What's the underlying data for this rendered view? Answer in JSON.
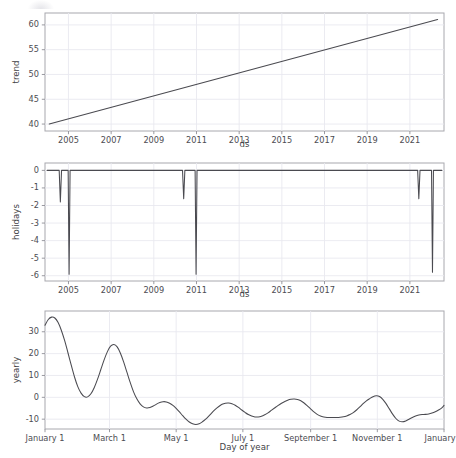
{
  "figure": {
    "background": "#ffffff",
    "line_color": "#4a4a50",
    "grid_color": "#e9e9ef",
    "frame_color": "#a8a8ae"
  },
  "chart_data": [
    {
      "type": "line",
      "name": "trend",
      "title": "",
      "xlabel": "ds",
      "ylabel": "trend",
      "grid": true,
      "legend": "none",
      "xlim": [
        2003.9,
        2022.6
      ],
      "ylim": [
        38.6,
        62.4
      ],
      "yticks": [
        40,
        45,
        50,
        55,
        60
      ],
      "yticklabels": [
        "40",
        "45",
        "50",
        "55",
        "60"
      ],
      "xticks": [
        2005,
        2007,
        2009,
        2011,
        2013,
        2015,
        2017,
        2019,
        2021
      ],
      "xticklabels": [
        "2005",
        "2007",
        "2009",
        "2011",
        "2013",
        "2015",
        "2017",
        "2019",
        "2021"
      ],
      "x": [
        2004.1,
        2022.3
      ],
      "y": [
        40.0,
        61.1
      ]
    },
    {
      "type": "line",
      "name": "holidays",
      "title": "",
      "xlabel": "ds",
      "ylabel": "holidays",
      "grid": true,
      "legend": "none",
      "xlim": [
        2003.9,
        2022.6
      ],
      "ylim": [
        -6.3,
        0.42
      ],
      "yticks": [
        0,
        -1,
        -2,
        -3,
        -4,
        -5,
        -6
      ],
      "yticklabels": [
        "0",
        "-1",
        "-2",
        "-3",
        "-4",
        "-5",
        "-6"
      ],
      "xticks": [
        2005,
        2007,
        2009,
        2011,
        2013,
        2015,
        2017,
        2019,
        2021
      ],
      "xticklabels": [
        "2005",
        "2007",
        "2009",
        "2011",
        "2013",
        "2015",
        "2017",
        "2019",
        "2021"
      ],
      "baseline": 0,
      "spikes": [
        {
          "x": 2004.62,
          "depth": -1.8,
          "half_width": 0.055
        },
        {
          "x": 2005.03,
          "depth": -5.92,
          "half_width": 0.045
        },
        {
          "x": 2010.4,
          "depth": -1.62,
          "half_width": 0.055
        },
        {
          "x": 2010.98,
          "depth": -5.92,
          "half_width": 0.045
        },
        {
          "x": 2021.42,
          "depth": -1.62,
          "half_width": 0.055
        },
        {
          "x": 2022.06,
          "depth": -5.8,
          "half_width": 0.045
        }
      ]
    },
    {
      "type": "line",
      "name": "yearly",
      "title": "",
      "xlabel": "Day of year",
      "ylabel": "yearly",
      "grid": true,
      "legend": "none",
      "xlim": [
        0,
        365
      ],
      "ylim": [
        -14.5,
        39.5
      ],
      "yticks": [
        30,
        20,
        10,
        0,
        -10
      ],
      "yticklabels": [
        "30",
        "20",
        "10",
        "0",
        "-10"
      ],
      "xticks": [
        0,
        59,
        120,
        181,
        243,
        304,
        365
      ],
      "xticklabels": [
        "January 1",
        "March 1",
        "May 1",
        "July 1",
        "September 1",
        "November 1",
        "January 1"
      ],
      "x": [
        0,
        3,
        6,
        9,
        12,
        15,
        18,
        21,
        24,
        27,
        30,
        33,
        36,
        39,
        42,
        45,
        48,
        51,
        54,
        57,
        60,
        63,
        66,
        69,
        72,
        75,
        78,
        81,
        84,
        87,
        90,
        93,
        96,
        99,
        102,
        105,
        108,
        111,
        114,
        117,
        120,
        123,
        126,
        129,
        132,
        135,
        138,
        141,
        144,
        147,
        150,
        153,
        156,
        159,
        162,
        165,
        168,
        171,
        174,
        177,
        180,
        183,
        186,
        189,
        192,
        195,
        198,
        201,
        204,
        207,
        210,
        213,
        216,
        219,
        222,
        225,
        228,
        231,
        234,
        237,
        240,
        243,
        246,
        249,
        252,
        255,
        258,
        261,
        264,
        267,
        270,
        273,
        276,
        279,
        282,
        285,
        288,
        291,
        294,
        297,
        300,
        303,
        306,
        309,
        312,
        315,
        318,
        321,
        324,
        327,
        330,
        333,
        336,
        339,
        342,
        345,
        348,
        351,
        354,
        357,
        360,
        363,
        365
      ],
      "y": [
        33.0,
        35.6,
        36.7,
        36.3,
        34.2,
        30.6,
        25.9,
        20.4,
        14.7,
        9.3,
        4.9,
        1.9,
        0.3,
        0.2,
        1.6,
        4.4,
        8.2,
        12.6,
        17.0,
        20.8,
        23.4,
        24.2,
        23.1,
        20.2,
        16.1,
        11.4,
        6.7,
        2.5,
        -0.7,
        -3.0,
        -4.4,
        -4.9,
        -4.7,
        -4.0,
        -3.1,
        -2.4,
        -2.0,
        -2.1,
        -2.7,
        -3.7,
        -5.1,
        -6.7,
        -8.4,
        -10.0,
        -11.3,
        -12.1,
        -12.4,
        -12.1,
        -11.2,
        -10.0,
        -8.5,
        -6.9,
        -5.4,
        -4.2,
        -3.2,
        -2.7,
        -2.6,
        -2.9,
        -3.6,
        -4.6,
        -5.8,
        -6.9,
        -7.9,
        -8.6,
        -9.0,
        -9.0,
        -8.7,
        -8.0,
        -7.1,
        -6.0,
        -4.9,
        -3.8,
        -2.8,
        -2.0,
        -1.3,
        -0.9,
        -0.8,
        -1.0,
        -1.6,
        -2.6,
        -3.9,
        -5.3,
        -6.7,
        -7.8,
        -8.6,
        -9.0,
        -9.2,
        -9.2,
        -9.2,
        -9.2,
        -9.1,
        -8.9,
        -8.5,
        -7.9,
        -7.0,
        -5.8,
        -4.4,
        -2.9,
        -1.6,
        -0.6,
        0.3,
        0.7,
        0.4,
        -0.9,
        -2.9,
        -5.3,
        -7.7,
        -9.7,
        -10.9,
        -11.2,
        -10.8,
        -10.0,
        -9.2,
        -8.5,
        -8.1,
        -7.9,
        -7.8,
        -7.6,
        -7.2,
        -6.6,
        -5.8,
        -4.8,
        -3.7,
        -2.6,
        -1.5,
        -0.3,
        1.2,
        3.0,
        5.2,
        7.5,
        9.4,
        10.4,
        10.1,
        8.6,
        6.2,
        3.5,
        1.3,
        0.1,
        0.3,
        1.9,
        4.9,
        9.2,
        14.4,
        20.2,
        26.0,
        31.1
      ]
    }
  ]
}
